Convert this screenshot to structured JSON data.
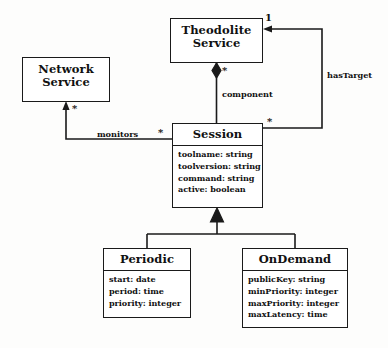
{
  "diagram": {
    "type": "uml-class-diagram",
    "background_color": "#fdfdfc",
    "line_color": "#1a1a1a",
    "classes": [
      {
        "id": "theodolite-service",
        "name": "Theodolite Service",
        "name_lines": [
          "Theodolite",
          "Service"
        ],
        "attributes": [],
        "x": 170,
        "y": 18,
        "w": 93,
        "h": 45
      },
      {
        "id": "network-service",
        "name": "Network Service",
        "name_lines": [
          "Network",
          "Service"
        ],
        "attributes": [],
        "x": 22,
        "y": 57,
        "w": 88,
        "h": 45
      },
      {
        "id": "session",
        "name": "Session",
        "name_lines": [
          "Session"
        ],
        "attributes": [
          "toolname: string",
          "toolversion: string",
          "command: string",
          "active: boolean"
        ],
        "x": 172,
        "y": 123,
        "w": 91,
        "h": 85
      },
      {
        "id": "periodic",
        "name": "Periodic",
        "name_lines": [
          "Periodic"
        ],
        "attributes": [
          "start: date",
          "period: time",
          "priority: integer"
        ],
        "x": 103,
        "y": 248,
        "w": 88,
        "h": 70
      },
      {
        "id": "ondemand",
        "name": "OnDemand",
        "name_lines": [
          "OnDemand"
        ],
        "attributes": [
          "publicKey: string",
          "minPriority: integer",
          "maxPriority: integer",
          "maxLatency: time"
        ],
        "x": 242,
        "y": 248,
        "w": 106,
        "h": 80
      }
    ],
    "relationships": [
      {
        "id": "component",
        "kind": "composition",
        "from": "theodolite-service",
        "to": "session",
        "label": "component",
        "source_multiplicity": "",
        "target_multiplicity": "*"
      },
      {
        "id": "has-target",
        "kind": "association-directed",
        "from": "session",
        "to": "theodolite-service",
        "label": "hasTarget",
        "source_multiplicity": "*",
        "target_multiplicity": "1"
      },
      {
        "id": "monitors",
        "kind": "association-directed",
        "from": "session",
        "to": "network-service",
        "label": "monitors",
        "source_multiplicity": "*",
        "target_multiplicity": "*"
      },
      {
        "id": "periodic-generalization",
        "kind": "generalization",
        "from": "periodic",
        "to": "session",
        "label": ""
      },
      {
        "id": "ondemand-generalization",
        "kind": "generalization",
        "from": "ondemand",
        "to": "session",
        "label": ""
      }
    ],
    "labels": {
      "component": "component",
      "has_target": "hasTarget",
      "monitors": "monitors",
      "mult_component_star": "*",
      "mult_has_target_one": "1",
      "mult_has_target_star": "*",
      "mult_monitors_source_star": "*",
      "mult_monitors_target_star": "*"
    }
  }
}
